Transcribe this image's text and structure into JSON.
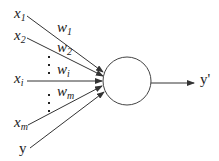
{
  "diagram": {
    "type": "perceptron",
    "inputs": [
      {
        "base": "x",
        "sub": "1"
      },
      {
        "base": "x",
        "sub": "2"
      },
      {
        "base": "x",
        "sub": "i"
      },
      {
        "base": "x",
        "sub": "m"
      },
      {
        "base": "y",
        "sub": ""
      }
    ],
    "weights": [
      {
        "base": "w",
        "sub": "1"
      },
      {
        "base": "w",
        "sub": "2"
      },
      {
        "base": "w",
        "sub": "i"
      },
      {
        "base": "w",
        "sub": "m"
      }
    ],
    "output": "y'",
    "colors": {
      "line": "#333333",
      "text": "#222222"
    }
  }
}
